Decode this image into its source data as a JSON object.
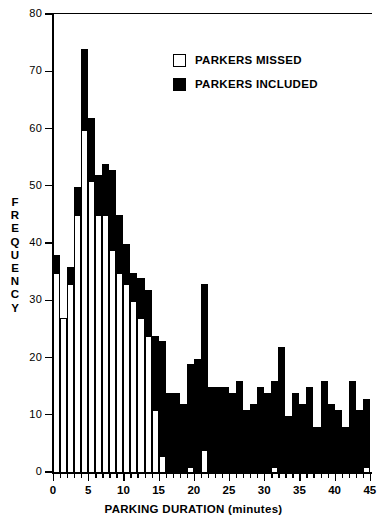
{
  "chart_data": {
    "type": "bar",
    "title": "",
    "xlabel": "PARKING DURATION (minutes)",
    "ylabel": "FREQUENCY",
    "ylim": [
      0,
      80
    ],
    "xlim": [
      0,
      45.5
    ],
    "ytick_values": [
      0,
      10,
      20,
      30,
      40,
      50,
      60,
      70,
      80
    ],
    "ytick_labels": [
      "0",
      "10",
      "20",
      "30",
      "40",
      "50",
      "60",
      "70",
      "80"
    ],
    "xtick_values": [
      0,
      5,
      10,
      15,
      20,
      25,
      30,
      35,
      40,
      45
    ],
    "xtick_labels": [
      "0",
      "5",
      "10",
      "15",
      "20",
      "25",
      "30",
      "35",
      "40",
      "45"
    ],
    "x_minor_step": 1,
    "grid": false,
    "stacked": true,
    "bar_width_minutes": 1,
    "legend_position": "upper right inside",
    "legend": [
      {
        "label": "PARKERS MISSED",
        "swatch": "open",
        "color": "#ffffff"
      },
      {
        "label": "PARKERS INCLUDED",
        "swatch": "filled",
        "color": "#000000"
      }
    ],
    "categories": [
      "0-1",
      "1-2",
      "2-3",
      "3-4",
      "4-5",
      "5-6",
      "6-7",
      "7-8",
      "8-9",
      "9-10",
      "10-11",
      "11-12",
      "12-13",
      "13-14",
      "14-15",
      "15-16",
      "16-17",
      "17-18",
      "18-19",
      "19-20",
      "20-21",
      "21-22",
      "22-23",
      "23-24",
      "24-25",
      "25-26",
      "26-27",
      "27-28",
      "28-29",
      "29-30",
      "30-31",
      "31-32",
      "32-33",
      "33-34",
      "34-35",
      "35-36",
      "36-37",
      "37-38",
      "38-39",
      "39-40",
      "40-41",
      "41-42",
      "42-43",
      "43-44",
      "44-45"
    ],
    "series": [
      {
        "name": "PARKERS MISSED",
        "color": "#ffffff",
        "values": [
          35,
          27,
          33,
          45,
          60,
          51,
          45,
          45,
          39,
          35,
          33,
          30,
          27,
          24,
          11,
          3,
          0,
          0,
          0,
          1,
          0,
          4,
          0,
          0,
          0,
          0,
          0,
          0,
          0,
          0,
          0,
          1,
          0,
          0,
          0,
          0,
          0,
          0,
          0,
          0,
          0,
          0,
          0,
          0,
          1
        ]
      },
      {
        "name": "PARKERS INCLUDED",
        "color": "#000000",
        "values": [
          3,
          0,
          3,
          5,
          14,
          11,
          7,
          9,
          14,
          10,
          7,
          5,
          7,
          8,
          13,
          20,
          14,
          14,
          12,
          18,
          20,
          29,
          15,
          15,
          15,
          14,
          16,
          11,
          12,
          15,
          14,
          15,
          22,
          10,
          14,
          12,
          15,
          8,
          16,
          12,
          11,
          8,
          16,
          11,
          12
        ]
      }
    ],
    "totals": [
      38,
      27,
      36,
      50,
      74,
      62,
      52,
      54,
      53,
      45,
      40,
      35,
      34,
      32,
      24,
      23,
      14,
      14,
      12,
      19,
      20,
      33,
      15,
      15,
      15,
      14,
      16,
      11,
      12,
      15,
      14,
      16,
      22,
      10,
      14,
      12,
      15,
      8,
      16,
      12,
      11,
      8,
      16,
      11,
      13
    ]
  }
}
